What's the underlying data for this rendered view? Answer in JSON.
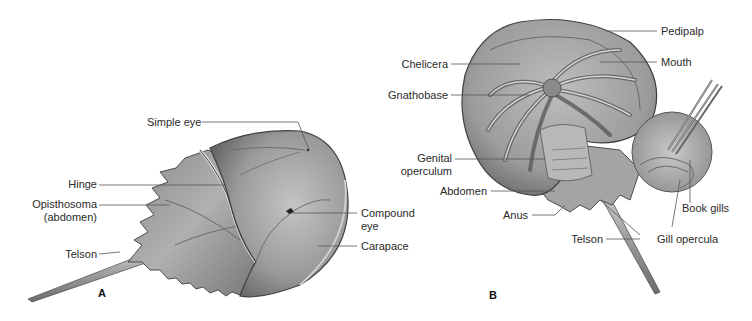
{
  "figure": {
    "panels": [
      {
        "id": "A",
        "letter": "A",
        "view": "dorsal",
        "labels": {
          "simple_eye": "Simple eye",
          "hinge": "Hinge",
          "opisthosoma_line1": "Opisthosoma",
          "opisthosoma_line2": "(abdomen)",
          "telson": "Telson",
          "compound_eye_line1": "Compound",
          "compound_eye_line2": "eye",
          "carapace": "Carapace"
        }
      },
      {
        "id": "B",
        "letter": "B",
        "view": "ventral",
        "labels": {
          "pedipalp": "Pedipalp",
          "mouth": "Mouth",
          "chelicera": "Chelicera",
          "gnathobase": "Gnathobase",
          "genital_operculum_line1": "Genital",
          "genital_operculum_line2": "operculum",
          "abdomen": "Abdomen",
          "anus": "Anus",
          "book_gills": "Book gills",
          "telson": "Telson",
          "gill_opercula": "Gill opercula"
        }
      }
    ],
    "colors": {
      "shell_mid": "#8c8c8c",
      "shell_light": "#bdbdbd",
      "shell_dark": "#4d4d4d",
      "leader_line": "#555555",
      "background": "#ffffff"
    }
  }
}
